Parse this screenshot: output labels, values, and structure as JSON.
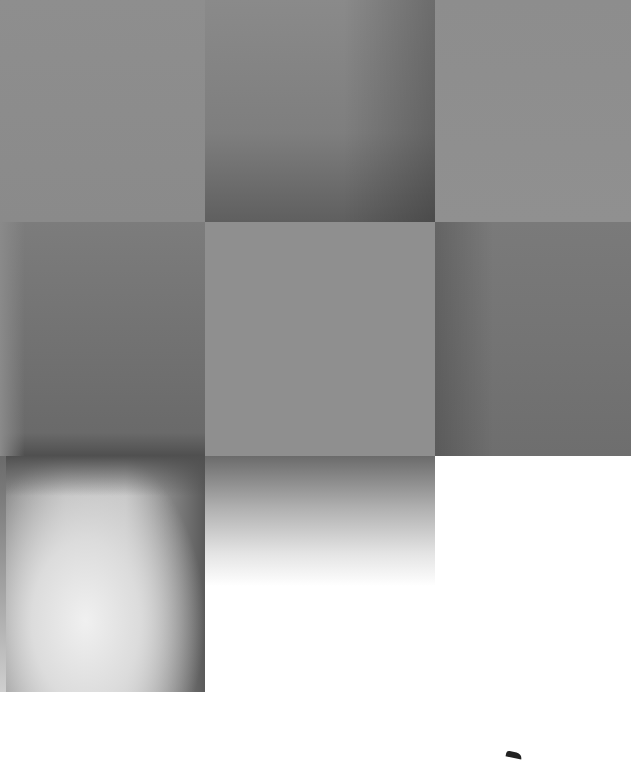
{
  "image": {
    "description": "Abstract composition of gray square tiles with gradients on white background",
    "width": 631,
    "height": 761,
    "background": "#ffffff",
    "tiles": [
      {
        "id": "r1c1",
        "color": "#8e8e8e"
      },
      {
        "id": "r1c2",
        "color": "#7e7e7e",
        "gradient_to": "#5f5f5f"
      },
      {
        "id": "r1c3",
        "color": "#8f8f8f"
      },
      {
        "id": "r2c1",
        "color": "#6f6f6f"
      },
      {
        "id": "r2c2",
        "color": "#8f8f8f"
      },
      {
        "id": "r2c3",
        "color": "#727272"
      },
      {
        "id": "r3c1",
        "color": "#bdbdbd",
        "gradient_to": "#f0f0f0"
      },
      {
        "id": "r3c2",
        "color": "#6b6b6b",
        "gradient_to": "#ffffff"
      }
    ]
  }
}
